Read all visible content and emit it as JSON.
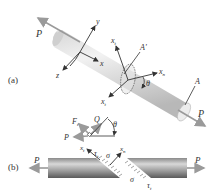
{
  "figure": {
    "panel_a": {
      "label": "(a)",
      "force_left": "P",
      "force_right": "P",
      "axis_x": "x",
      "axis_y": "y",
      "axis_z": "z",
      "axis_xn": "x",
      "axis_xn_sub": "n",
      "axis_xt": "x",
      "axis_xt_sub": "t",
      "axis_xt2": "x",
      "axis_xt2_sub": "t",
      "area_inclined": "A'",
      "area": "A",
      "angle": "θ"
    },
    "panel_b": {
      "label": "(b)",
      "force_left": "P",
      "force_right": "P",
      "fbd_F": "F",
      "fbd_F_sub": "t",
      "fbd_Q": "Q",
      "fbd_P": "P",
      "fbd_angle": "θ",
      "axis_xt": "x",
      "axis_xt_sub": "t",
      "axis_xn": "x",
      "axis_xn_sub": "n",
      "tau_left": "τ",
      "tau_left_sub": "t",
      "sigma_left": "σ",
      "sigma_right": "σ",
      "tau_right": "τ",
      "tau_right_sub": "t"
    },
    "colors": {
      "bar_light": "#e8e8e8",
      "bar_mid": "#c4c4c4",
      "bar_dark": "#6a6a6a",
      "arrow_gray": "#9a9a9a",
      "line_dark": "#333333"
    }
  }
}
